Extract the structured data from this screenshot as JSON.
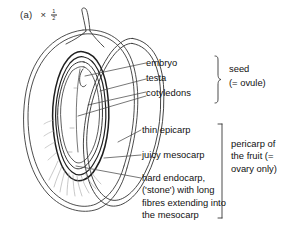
{
  "figure": {
    "caption_label": "(a)",
    "magnification_symbol": "×",
    "magnification_numerator": "1",
    "magnification_denominator": "2"
  },
  "labels": {
    "embryo": "embryo",
    "testa": "testa",
    "cotyledons": "cotyledons",
    "thin_epicarp": "thin epicarp",
    "juicy_mesocarp": "juicy mesocarp",
    "hard_endocarp": "hard endocarp, ('stone') with long fibres extending into the mesocarp"
  },
  "groups": {
    "seed": {
      "line1": "seed",
      "line2": "(= ovule)"
    },
    "pericarp": {
      "text": "pericarp of the fruit (= ovary only)"
    }
  },
  "colors": {
    "ink": "#111111",
    "line": "#3a3a3a",
    "background": "#ffffff",
    "fibre": "#9a9a9a"
  }
}
